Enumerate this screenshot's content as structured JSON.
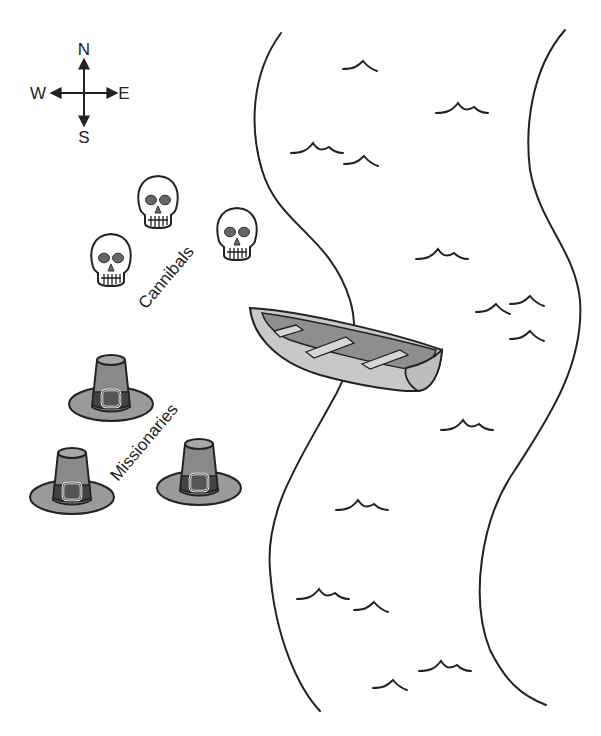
{
  "compass": {
    "north": "N",
    "south": "S",
    "east": "E",
    "west": "W"
  },
  "labels": {
    "cannibals": "Cannibals",
    "missionaries": "Missionaries"
  },
  "groups": {
    "cannibals": {
      "count": 3,
      "icon": "skull-icon"
    },
    "missionaries": {
      "count": 3,
      "icon": "pilgrim-hat-icon"
    }
  },
  "objects": {
    "boat": {
      "icon": "rowboat-icon",
      "seats": 3
    },
    "river": {
      "icon": "river-icon"
    }
  },
  "colors": {
    "line": "#222222",
    "fill_gray": "#9a9a9a",
    "fill_dark": "#555555",
    "boat_light": "#c8c8c8",
    "background": "#ffffff"
  }
}
